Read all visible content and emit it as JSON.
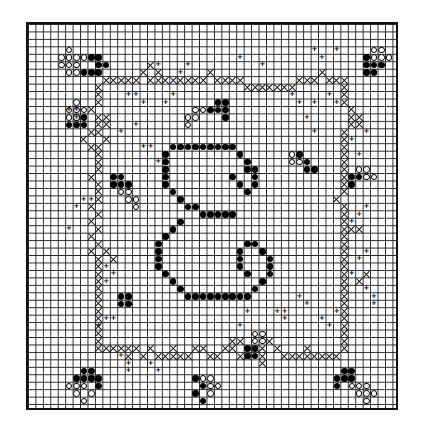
{
  "chart": {
    "title": "",
    "grid": {
      "cols": 50,
      "rows": 52
    },
    "symbols": {
      "dot": "filled stitch (dark)",
      "circ": "open circle stitch (light)",
      "cross": "cross stitch (vine)",
      "plus": "backstitch / tendril marker"
    },
    "plus_glyph": "+",
    "cells": {
      "dot": [
        [
          19,
          16
        ],
        [
          20,
          16
        ],
        [
          21,
          16
        ],
        [
          22,
          16
        ],
        [
          23,
          16
        ],
        [
          24,
          16
        ],
        [
          25,
          16
        ],
        [
          26,
          16
        ],
        [
          27,
          16
        ],
        [
          18,
          17
        ],
        [
          28,
          17
        ],
        [
          18,
          18
        ],
        [
          29,
          18
        ],
        [
          18,
          19
        ],
        [
          29,
          19
        ],
        [
          18,
          20
        ],
        [
          30,
          19
        ],
        [
          30,
          20
        ],
        [
          30,
          21
        ],
        [
          27,
          20
        ],
        [
          28,
          21
        ],
        [
          29,
          22
        ],
        [
          18,
          21
        ],
        [
          19,
          22
        ],
        [
          20,
          23
        ],
        [
          21,
          24
        ],
        [
          22,
          24
        ],
        [
          23,
          25
        ],
        [
          24,
          25
        ],
        [
          25,
          25
        ],
        [
          26,
          25
        ],
        [
          27,
          25
        ],
        [
          20,
          26
        ],
        [
          19,
          27
        ],
        [
          18,
          28
        ],
        [
          17,
          29
        ],
        [
          17,
          30
        ],
        [
          17,
          31
        ],
        [
          17,
          32
        ],
        [
          18,
          33
        ],
        [
          19,
          34
        ],
        [
          20,
          35
        ],
        [
          21,
          36
        ],
        [
          22,
          36
        ],
        [
          23,
          36
        ],
        [
          24,
          36
        ],
        [
          25,
          36
        ],
        [
          26,
          36
        ],
        [
          27,
          36
        ],
        [
          28,
          36
        ],
        [
          29,
          36
        ],
        [
          30,
          35
        ],
        [
          31,
          34
        ],
        [
          32,
          33
        ],
        [
          32,
          32
        ],
        [
          32,
          31
        ],
        [
          31,
          30
        ],
        [
          30,
          29
        ],
        [
          29,
          29
        ],
        [
          28,
          30
        ],
        [
          28,
          31
        ],
        [
          28,
          32
        ],
        [
          29,
          33
        ],
        [
          8,
          4
        ],
        [
          9,
          4
        ],
        [
          9,
          5
        ],
        [
          10,
          5
        ],
        [
          8,
          6
        ],
        [
          9,
          6
        ],
        [
          7,
          6
        ],
        [
          6,
          12
        ],
        [
          7,
          12
        ],
        [
          5,
          13
        ],
        [
          6,
          13
        ],
        [
          7,
          13
        ],
        [
          11,
          20
        ],
        [
          12,
          20
        ],
        [
          11,
          21
        ],
        [
          12,
          21
        ],
        [
          13,
          21
        ],
        [
          25,
          10
        ],
        [
          26,
          10
        ],
        [
          24,
          11
        ],
        [
          25,
          11
        ],
        [
          26,
          11
        ],
        [
          26,
          12
        ],
        [
          7,
          46
        ],
        [
          8,
          46
        ],
        [
          6,
          47
        ],
        [
          7,
          47
        ],
        [
          8,
          47
        ],
        [
          9,
          47
        ],
        [
          9,
          48
        ],
        [
          22,
          47
        ],
        [
          23,
          48
        ],
        [
          22,
          49
        ],
        [
          23,
          50
        ],
        [
          42,
          46
        ],
        [
          43,
          46
        ],
        [
          41,
          47
        ],
        [
          42,
          47
        ],
        [
          43,
          47
        ],
        [
          41,
          48
        ],
        [
          36,
          17
        ],
        [
          37,
          18
        ],
        [
          37,
          19
        ],
        [
          38,
          19
        ],
        [
          43,
          20
        ],
        [
          44,
          20
        ],
        [
          43,
          21
        ],
        [
          45,
          4
        ],
        [
          45,
          5
        ],
        [
          46,
          5
        ],
        [
          45,
          6
        ],
        [
          46,
          6
        ],
        [
          47,
          5
        ],
        [
          12,
          36
        ],
        [
          13,
          36
        ],
        [
          12,
          37
        ],
        [
          13,
          37
        ],
        [
          29,
          43
        ],
        [
          30,
          43
        ],
        [
          29,
          44
        ],
        [
          30,
          44
        ]
      ],
      "circ": [
        [
          5,
          3
        ],
        [
          4,
          4
        ],
        [
          5,
          4
        ],
        [
          6,
          4
        ],
        [
          7,
          4
        ],
        [
          4,
          5
        ],
        [
          5,
          5
        ],
        [
          6,
          5
        ],
        [
          5,
          6
        ],
        [
          6,
          6
        ],
        [
          6,
          10
        ],
        [
          5,
          11
        ],
        [
          6,
          11
        ],
        [
          7,
          11
        ],
        [
          6,
          12
        ],
        [
          5,
          12
        ],
        [
          12,
          22
        ],
        [
          13,
          22
        ],
        [
          14,
          23
        ],
        [
          13,
          23
        ],
        [
          14,
          24
        ],
        [
          22,
          11
        ],
        [
          23,
          11
        ],
        [
          22,
          12
        ],
        [
          21,
          12
        ],
        [
          21,
          13
        ],
        [
          6,
          49
        ],
        [
          5,
          48
        ],
        [
          6,
          48
        ],
        [
          7,
          48
        ],
        [
          8,
          49
        ],
        [
          7,
          50
        ],
        [
          23,
          47
        ],
        [
          24,
          47
        ],
        [
          24,
          48
        ],
        [
          25,
          48
        ],
        [
          24,
          49
        ],
        [
          43,
          48
        ],
        [
          44,
          48
        ],
        [
          45,
          48
        ],
        [
          44,
          49
        ],
        [
          45,
          49
        ],
        [
          46,
          49
        ],
        [
          45,
          50
        ],
        [
          35,
          17
        ],
        [
          35,
          18
        ],
        [
          36,
          18
        ],
        [
          45,
          19
        ],
        [
          44,
          19
        ],
        [
          45,
          20
        ],
        [
          46,
          20
        ],
        [
          47,
          3
        ],
        [
          46,
          3
        ],
        [
          46,
          4
        ],
        [
          47,
          4
        ],
        [
          48,
          4
        ],
        [
          30,
          41
        ],
        [
          31,
          41
        ],
        [
          30,
          42
        ],
        [
          31,
          42
        ]
      ],
      "cross": [
        [
          10,
          7
        ],
        [
          11,
          7
        ],
        [
          12,
          7
        ],
        [
          13,
          7
        ],
        [
          14,
          7
        ],
        [
          16,
          7
        ],
        [
          17,
          7
        ],
        [
          18,
          7
        ],
        [
          19,
          7
        ],
        [
          20,
          7
        ],
        [
          21,
          7
        ],
        [
          22,
          7
        ],
        [
          23,
          7
        ],
        [
          15,
          6
        ],
        [
          16,
          5
        ],
        [
          17,
          6
        ],
        [
          24,
          6
        ],
        [
          25,
          7
        ],
        [
          26,
          7
        ],
        [
          27,
          7
        ],
        [
          28,
          7
        ],
        [
          29,
          8
        ],
        [
          30,
          8
        ],
        [
          31,
          8
        ],
        [
          32,
          8
        ],
        [
          33,
          8
        ],
        [
          34,
          8
        ],
        [
          35,
          8
        ],
        [
          36,
          7
        ],
        [
          37,
          7
        ],
        [
          38,
          7
        ],
        [
          39,
          6
        ],
        [
          40,
          7
        ],
        [
          41,
          7
        ],
        [
          42,
          7
        ],
        [
          42,
          8
        ],
        [
          42,
          9
        ],
        [
          42,
          10
        ],
        [
          43,
          11
        ],
        [
          43,
          12
        ],
        [
          43,
          13
        ],
        [
          42,
          14
        ],
        [
          42,
          15
        ],
        [
          42,
          16
        ],
        [
          42,
          17
        ],
        [
          42,
          18
        ],
        [
          42,
          19
        ],
        [
          42,
          20
        ],
        [
          42,
          21
        ],
        [
          42,
          22
        ],
        [
          41,
          23
        ],
        [
          42,
          24
        ],
        [
          42,
          25
        ],
        [
          42,
          26
        ],
        [
          42,
          27
        ],
        [
          42,
          28
        ],
        [
          42,
          29
        ],
        [
          42,
          30
        ],
        [
          42,
          31
        ],
        [
          42,
          32
        ],
        [
          42,
          33
        ],
        [
          42,
          34
        ],
        [
          42,
          35
        ],
        [
          42,
          36
        ],
        [
          42,
          37
        ],
        [
          42,
          38
        ],
        [
          42,
          39
        ],
        [
          42,
          40
        ],
        [
          42,
          41
        ],
        [
          42,
          42
        ],
        [
          42,
          43
        ],
        [
          44,
          12
        ],
        [
          44,
          13
        ],
        [
          43,
          27
        ],
        [
          44,
          27
        ],
        [
          44,
          34
        ],
        [
          45,
          33
        ],
        [
          9,
          8
        ],
        [
          9,
          9
        ],
        [
          9,
          10
        ],
        [
          8,
          11
        ],
        [
          9,
          12
        ],
        [
          9,
          13
        ],
        [
          9,
          14
        ],
        [
          10,
          15
        ],
        [
          8,
          16
        ],
        [
          9,
          16
        ],
        [
          9,
          17
        ],
        [
          9,
          18
        ],
        [
          9,
          19
        ],
        [
          8,
          20
        ],
        [
          9,
          21
        ],
        [
          9,
          22
        ],
        [
          9,
          23
        ],
        [
          8,
          24
        ],
        [
          9,
          25
        ],
        [
          8,
          26
        ],
        [
          9,
          27
        ],
        [
          8,
          28
        ],
        [
          9,
          29
        ],
        [
          8,
          30
        ],
        [
          9,
          31
        ],
        [
          9,
          32
        ],
        [
          9,
          33
        ],
        [
          9,
          34
        ],
        [
          9,
          35
        ],
        [
          9,
          36
        ],
        [
          9,
          37
        ],
        [
          9,
          38
        ],
        [
          9,
          39
        ],
        [
          9,
          40
        ],
        [
          9,
          41
        ],
        [
          9,
          42
        ],
        [
          9,
          43
        ],
        [
          10,
          12
        ],
        [
          10,
          13
        ],
        [
          8,
          14
        ],
        [
          7,
          15
        ],
        [
          10,
          30
        ],
        [
          11,
          31
        ],
        [
          10,
          43
        ],
        [
          11,
          43
        ],
        [
          12,
          43
        ],
        [
          13,
          43
        ],
        [
          14,
          43
        ],
        [
          15,
          44
        ],
        [
          16,
          43
        ],
        [
          17,
          44
        ],
        [
          18,
          44
        ],
        [
          19,
          43
        ],
        [
          20,
          44
        ],
        [
          21,
          44
        ],
        [
          22,
          43
        ],
        [
          23,
          43
        ],
        [
          24,
          44
        ],
        [
          25,
          44
        ],
        [
          26,
          43
        ],
        [
          27,
          43
        ],
        [
          28,
          44
        ],
        [
          29,
          44
        ],
        [
          30,
          43
        ],
        [
          31,
          43
        ],
        [
          32,
          42
        ],
        [
          33,
          43
        ],
        [
          34,
          44
        ],
        [
          35,
          44
        ],
        [
          36,
          44
        ],
        [
          37,
          44
        ],
        [
          38,
          44
        ],
        [
          39,
          44
        ],
        [
          40,
          44
        ],
        [
          41,
          44
        ],
        [
          13,
          44
        ],
        [
          19,
          44
        ],
        [
          27,
          42
        ],
        [
          28,
          42
        ],
        [
          31,
          44
        ],
        [
          31,
          45
        ],
        [
          37,
          43
        ]
      ],
      "plus": [
        [
          17,
          5
        ],
        [
          20,
          6
        ],
        [
          21,
          5
        ],
        [
          28,
          4
        ],
        [
          31,
          5
        ],
        [
          38,
          3
        ],
        [
          39,
          4
        ],
        [
          41,
          3
        ],
        [
          13,
          9
        ],
        [
          14,
          9
        ],
        [
          15,
          10
        ],
        [
          18,
          10
        ],
        [
          19,
          9
        ],
        [
          35,
          9
        ],
        [
          36,
          10
        ],
        [
          38,
          10
        ],
        [
          40,
          9
        ],
        [
          41,
          10
        ],
        [
          5,
          11
        ],
        [
          6,
          11
        ],
        [
          6,
          12
        ],
        [
          12,
          14
        ],
        [
          14,
          13
        ],
        [
          15,
          16
        ],
        [
          16,
          16
        ],
        [
          17,
          18
        ],
        [
          38,
          14
        ],
        [
          37,
          12
        ],
        [
          43,
          15
        ],
        [
          45,
          14
        ],
        [
          44,
          17
        ],
        [
          44,
          25
        ],
        [
          43,
          26
        ],
        [
          45,
          24
        ],
        [
          44,
          31
        ],
        [
          43,
          33
        ],
        [
          45,
          30
        ],
        [
          7,
          23
        ],
        [
          8,
          23
        ],
        [
          6,
          24
        ],
        [
          5,
          27
        ],
        [
          10,
          32
        ],
        [
          10,
          34
        ],
        [
          11,
          33
        ],
        [
          10,
          39
        ],
        [
          11,
          39
        ],
        [
          9,
          40
        ],
        [
          12,
          44
        ],
        [
          13,
          45
        ],
        [
          13,
          46
        ],
        [
          16,
          45
        ],
        [
          17,
          46
        ],
        [
          29,
          38
        ],
        [
          28,
          40
        ],
        [
          33,
          38
        ],
        [
          34,
          38
        ],
        [
          34,
          39
        ],
        [
          36,
          36
        ],
        [
          37,
          37
        ],
        [
          39,
          39
        ],
        [
          40,
          40
        ],
        [
          41,
          38
        ],
        [
          45,
          35
        ],
        [
          46,
          36
        ],
        [
          46,
          37
        ]
      ]
    }
  }
}
